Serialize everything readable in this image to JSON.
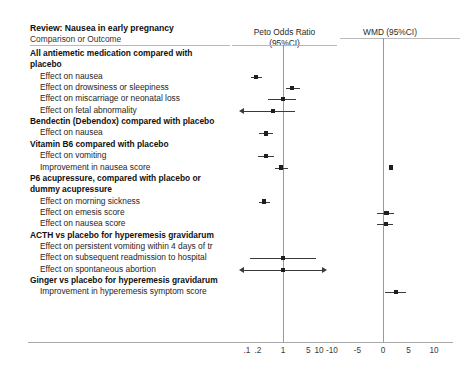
{
  "header": {
    "review_title": "Review: Nausea in early pregnancy",
    "comparison_label": "Comparison or Outcome",
    "col_peto_line1": "Peto Odds Ratio",
    "col_peto_line2": "(95%CI)",
    "col_wmd": "WMD (95%CI)"
  },
  "axis": {
    "peto_ticks": [
      ".1",
      ".2",
      "1",
      "5",
      "10"
    ],
    "wmd_ticks": [
      "-10",
      "-5",
      "0",
      "5",
      "10"
    ],
    "peto_null": "1",
    "wmd_null": "0"
  },
  "rows": [
    {
      "label": "All antiemetic medication compared with",
      "kind": "group"
    },
    {
      "label": "placebo",
      "kind": "group"
    },
    {
      "label": "Effect on nausea",
      "kind": "outcome",
      "scale": "peto",
      "point": 0.18,
      "lo": 0.13,
      "hi": 0.26,
      "clip_lo": false,
      "clip_hi": false
    },
    {
      "label": "Effect on drowsiness or sleepiness",
      "kind": "outcome",
      "scale": "peto",
      "point": 1.8,
      "lo": 1.18,
      "hi": 2.95,
      "clip_lo": false,
      "clip_hi": false
    },
    {
      "label": "Effect on miscarriage or neonatal loss",
      "kind": "outcome",
      "scale": "peto",
      "point": 1.0,
      "lo": 0.38,
      "hi": 2.3,
      "clip_lo": false,
      "clip_hi": false
    },
    {
      "label": "Effect on fetal abnormality",
      "kind": "outcome",
      "scale": "peto",
      "point": 0.52,
      "lo": 0.08,
      "hi": 2.1,
      "clip_lo": true,
      "clip_hi": false
    },
    {
      "label": "Bendectin (Debendox) compared with placebo",
      "kind": "group"
    },
    {
      "label": "Effect on nausea",
      "kind": "outcome",
      "scale": "peto",
      "point": 0.33,
      "lo": 0.21,
      "hi": 0.52,
      "clip_lo": false,
      "clip_hi": false
    },
    {
      "label": "Vitamin B6 compared with placebo",
      "kind": "group"
    },
    {
      "label": "Effect on vomiting",
      "kind": "outcome",
      "scale": "peto",
      "point": 0.33,
      "lo": 0.2,
      "hi": 0.55,
      "clip_lo": false,
      "clip_hi": false
    },
    {
      "label": "Improvement in nausea score",
      "kind": "outcome",
      "scale": "peto",
      "point": 0.87,
      "lo": 0.6,
      "hi": 1.35,
      "clip_lo": false,
      "clip_hi": false
    },
    {
      "label": "Improvement in nausea score",
      "kind": "outcome",
      "scale": "wmd",
      "point": 1.5,
      "lo": 1.1,
      "hi": 1.9,
      "clip_lo": false,
      "clip_hi": false,
      "hidden_label": true
    },
    {
      "label": "P6 acupressure, compared with placebo or",
      "kind": "group"
    },
    {
      "label": "dummy acupressure",
      "kind": "group"
    },
    {
      "label": "Effect on morning sickness",
      "kind": "outcome",
      "scale": "peto",
      "point": 0.3,
      "lo": 0.21,
      "hi": 0.44,
      "clip_lo": false,
      "clip_hi": false
    },
    {
      "label": "Effect on emesis score",
      "kind": "outcome",
      "scale": "wmd",
      "point": 0.7,
      "lo": -1.1,
      "hi": 2.1,
      "clip_lo": false,
      "clip_hi": false
    },
    {
      "label": "Effect on nausea score",
      "kind": "outcome",
      "scale": "wmd",
      "point": 0.6,
      "lo": -1.2,
      "hi": 2.0,
      "clip_lo": false,
      "clip_hi": false
    },
    {
      "label": "ACTH vs placebo for hyperemesis gravidarum",
      "kind": "group"
    },
    {
      "label": "Effect on persistent vomiting within 4 days of tr",
      "kind": "outcome",
      "scale": "none"
    },
    {
      "label": "Effect on subsequent readmission to hospital",
      "kind": "outcome",
      "scale": "peto",
      "point": 1.0,
      "lo": 0.12,
      "hi": 8.4,
      "clip_lo": false,
      "clip_hi": false
    },
    {
      "label": "Effect on spontaneous abortion",
      "kind": "outcome",
      "scale": "peto",
      "point": 1.0,
      "lo": 0.08,
      "hi": 12.0,
      "clip_lo": true,
      "clip_hi": true
    },
    {
      "label": "Ginger vs placebo for hyperemesis gravidarum",
      "kind": "group"
    },
    {
      "label": "Improvement in hyperemesis symptom score",
      "kind": "outcome",
      "scale": "wmd",
      "point": 2.5,
      "lo": 0.4,
      "hi": 4.6,
      "clip_lo": false,
      "clip_hi": false
    }
  ]
}
